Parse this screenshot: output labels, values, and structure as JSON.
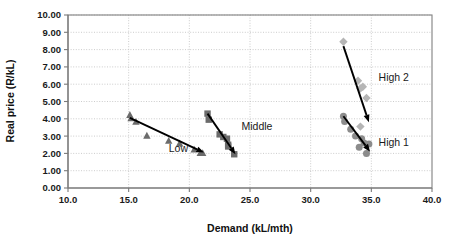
{
  "chart_data": {
    "type": "scatter",
    "title": "",
    "xlabel": "Demand (kL/mth)",
    "ylabel": "Real price (R/kL)",
    "xlim": [
      10.0,
      40.0
    ],
    "ylim": [
      0.0,
      10.0
    ],
    "xticks": [
      "10.0",
      "15.0",
      "20.0",
      "25.0",
      "30.0",
      "35.0",
      "40.0"
    ],
    "yticks": [
      "0.00",
      "1.00",
      "2.00",
      "3.00",
      "4.00",
      "5.00",
      "6.00",
      "7.00",
      "8.00",
      "9.00",
      "10.00"
    ],
    "grid": true,
    "legend_position": "inline-annotations",
    "series": [
      {
        "name": "Low",
        "marker": "triangle",
        "color": "#6b6b6b",
        "points": [
          [
            15.1,
            4.25
          ],
          [
            15.2,
            4.05
          ],
          [
            15.6,
            3.85
          ],
          [
            16.5,
            3.05
          ],
          [
            18.3,
            2.75
          ],
          [
            19.2,
            2.6
          ],
          [
            20.4,
            2.25
          ],
          [
            20.9,
            2.05
          ],
          [
            21.1,
            2.05
          ]
        ],
        "trend": {
          "x1": 15.1,
          "y1": 4.05,
          "x2": 21.2,
          "y2": 2.05
        }
      },
      {
        "name": "Middle",
        "marker": "square",
        "color": "#6b6b6b",
        "points": [
          [
            21.5,
            4.3
          ],
          [
            21.6,
            3.95
          ],
          [
            22.5,
            3.1
          ],
          [
            22.8,
            2.95
          ],
          [
            23.1,
            2.85
          ],
          [
            23.2,
            2.5
          ],
          [
            23.2,
            2.4
          ],
          [
            23.7,
            1.95
          ]
        ],
        "trend": {
          "x1": 21.5,
          "y1": 4.3,
          "x2": 23.8,
          "y2": 1.95
        }
      },
      {
        "name": "High 1",
        "marker": "circle",
        "color": "#8c8c8c",
        "points": [
          [
            32.7,
            4.15
          ],
          [
            32.8,
            3.85
          ],
          [
            33.3,
            3.4
          ],
          [
            33.7,
            3.0
          ],
          [
            34.0,
            2.35
          ],
          [
            34.2,
            2.85
          ],
          [
            34.4,
            2.6
          ],
          [
            34.6,
            2.0
          ],
          [
            34.8,
            2.55
          ]
        ],
        "trend": {
          "x1": 32.7,
          "y1": 4.15,
          "x2": 34.9,
          "y2": 2.1
        }
      },
      {
        "name": "High 2",
        "marker": "diamond",
        "color": "#b5b5b5",
        "points": [
          [
            32.7,
            8.45
          ],
          [
            33.9,
            6.2
          ],
          [
            34.1,
            5.75
          ],
          [
            34.3,
            5.85
          ],
          [
            34.6,
            5.2
          ],
          [
            34.1,
            3.55
          ]
        ],
        "trend": {
          "x1": 32.7,
          "y1": 8.2,
          "x2": 34.8,
          "y2": 3.8
        }
      }
    ],
    "annotations": [
      {
        "text": "Low",
        "x": 18.3,
        "y": 2.1
      },
      {
        "text": "Middle",
        "x": 24.3,
        "y": 3.35
      },
      {
        "text": "High 2",
        "x": 35.6,
        "y": 6.2
      },
      {
        "text": "High 1",
        "x": 35.6,
        "y": 2.45
      }
    ]
  }
}
